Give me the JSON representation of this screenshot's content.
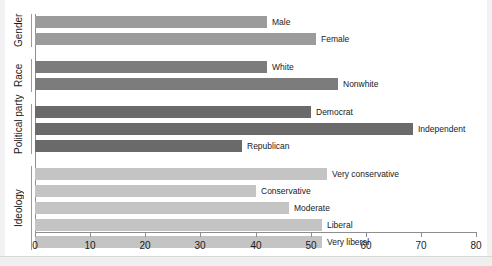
{
  "chart_data": {
    "type": "bar",
    "orientation": "horizontal",
    "title": "",
    "xlabel": "",
    "ylabel": "",
    "xlim": [
      0,
      80
    ],
    "xticks": [
      0,
      10,
      20,
      30,
      40,
      50,
      60,
      70,
      80
    ],
    "grid": false,
    "legend": false,
    "categories": [
      "Male",
      "Female",
      "White",
      "Nonwhite",
      "Democrat",
      "Independent",
      "Republican",
      "Very conservative",
      "Conservative",
      "Moderate",
      "Liberal",
      "Very liberal"
    ],
    "values": [
      42,
      51,
      42,
      55,
      50,
      68.5,
      37.5,
      53,
      40,
      46,
      52,
      52
    ],
    "groups": [
      {
        "name": "Gender",
        "color": "#9b9b9b",
        "bars": [
          {
            "label": "Male",
            "value": 42
          },
          {
            "label": "Female",
            "value": 51
          }
        ]
      },
      {
        "name": "Race",
        "color": "#7c7c7c",
        "bars": [
          {
            "label": "White",
            "value": 42
          },
          {
            "label": "Nonwhite",
            "value": 55
          }
        ]
      },
      {
        "name": "Political party",
        "color": "#6a6a6a",
        "bars": [
          {
            "label": "Democrat",
            "value": 50
          },
          {
            "label": "Independent",
            "value": 68.5
          },
          {
            "label": "Republican",
            "value": 37.5
          }
        ]
      },
      {
        "name": "Ideology",
        "color": "#c4c4c4",
        "bars": [
          {
            "label": "Very conservative",
            "value": 53
          },
          {
            "label": "Conservative",
            "value": 40
          },
          {
            "label": "Moderate",
            "value": 46
          },
          {
            "label": "Liberal",
            "value": 52
          },
          {
            "label": "Very liberal",
            "value": 52
          }
        ]
      }
    ]
  },
  "axis": {
    "tick_labels": [
      "0",
      "10",
      "20",
      "30",
      "40",
      "50",
      "60",
      "70",
      "80"
    ]
  },
  "colors": {
    "gender": "#9b9b9b",
    "race": "#7c7c7c",
    "political_party": "#6a6a6a",
    "ideology": "#c4c4c4",
    "axis": "#8e8e8e",
    "text": "#1a1a1a"
  }
}
